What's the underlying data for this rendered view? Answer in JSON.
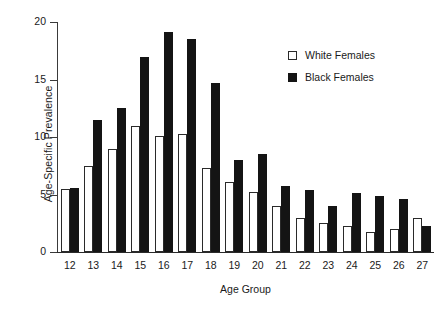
{
  "chart_data": {
    "type": "bar",
    "title": "",
    "xlabel": "Age Group",
    "ylabel": "Age-Specific Prevalence",
    "categories": [
      "12",
      "13",
      "14",
      "15",
      "16",
      "17",
      "18",
      "19",
      "20",
      "21",
      "22",
      "23",
      "24",
      "25",
      "26",
      "27"
    ],
    "series": [
      {
        "name": "White Females",
        "color": "#ffffff",
        "values": [
          5.5,
          7.5,
          9.0,
          11.0,
          10.1,
          10.3,
          7.3,
          6.1,
          5.2,
          4.0,
          3.0,
          2.5,
          2.3,
          1.7,
          2.0,
          3.0
        ]
      },
      {
        "name": "Black Females",
        "color": "#141414",
        "values": [
          5.6,
          11.5,
          12.5,
          17.0,
          19.1,
          18.5,
          14.7,
          8.0,
          8.5,
          5.7,
          5.4,
          4.0,
          5.1,
          4.9,
          4.6,
          2.3
        ]
      }
    ],
    "ylim": [
      0,
      20
    ],
    "yticks": [
      "0",
      "5",
      "10",
      "15",
      "20"
    ],
    "ytick_values": [
      0,
      5,
      10,
      15,
      20
    ],
    "grid": false,
    "legend_position": "top-right"
  },
  "legend": {
    "items": [
      {
        "label": "White Females",
        "swatch": "open-square"
      },
      {
        "label": "Black Females",
        "swatch": "filled-square"
      }
    ]
  }
}
